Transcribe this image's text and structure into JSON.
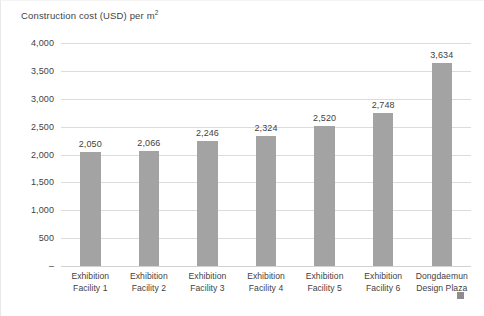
{
  "chart_data": {
    "type": "bar",
    "title": "Construction cost (USD) per m",
    "title_superscript": "2",
    "xlabel": "",
    "ylabel": "",
    "ylim": [
      0,
      4000
    ],
    "ytick_step": 500,
    "grid": true,
    "legend": null,
    "bar_color": "#a3a3a3",
    "gridline_color": "#dcdcdc",
    "text_color": "#3f3f3f",
    "ytick_labels": [
      "4,000",
      "3,500",
      "3,000",
      "2,500",
      "2,000",
      "1,500",
      "1,000",
      "500",
      "–"
    ],
    "ytick_values": [
      4000,
      3500,
      3000,
      2500,
      2000,
      1500,
      1000,
      500,
      0
    ],
    "categories": [
      "Exhibition Facility 1",
      "Exhibition Facility 2",
      "Exhibition Facility 3",
      "Exhibition Facility 4",
      "Exhibition Facility 5",
      "Exhibition Facility 6",
      "Dongdaemun Design Plaza"
    ],
    "category_lines": [
      {
        "line1": "Exhibition",
        "line2": "Facility 1"
      },
      {
        "line1": "Exhibition",
        "line2": "Facility 2"
      },
      {
        "line1": "Exhibition",
        "line2": "Facility 3"
      },
      {
        "line1": "Exhibition",
        "line2": "Facility 4"
      },
      {
        "line1": "Exhibition",
        "line2": "Facility 5"
      },
      {
        "line1": "Exhibition",
        "line2": "Facility 6"
      },
      {
        "line1": "Dongdaemun",
        "line2": "Design Plaza"
      }
    ],
    "values": [
      2050,
      2066,
      2246,
      2324,
      2520,
      2748,
      3634
    ],
    "value_labels": [
      "2,050",
      "2,066",
      "2,246",
      "2,324",
      "2,520",
      "2,748",
      "3,634"
    ]
  }
}
